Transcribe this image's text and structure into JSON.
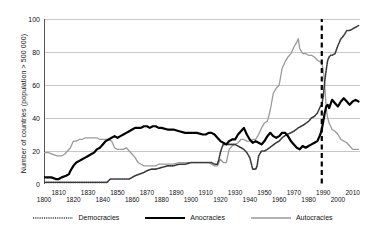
{
  "chart_data": {
    "type": "line",
    "title": "",
    "xlabel": "",
    "ylabel": "Number of countries (population > 500 000)",
    "xlim": [
      1800,
      2015
    ],
    "ylim": [
      0,
      100
    ],
    "grid": true,
    "legend_position": "bottom",
    "xticks": [
      1800,
      1810,
      1820,
      1830,
      1840,
      1850,
      1860,
      1870,
      1880,
      1890,
      1900,
      1910,
      1920,
      1930,
      1940,
      1950,
      1960,
      1970,
      1980,
      1990,
      2000,
      2010
    ],
    "yticks": [
      0,
      20,
      40,
      60,
      80,
      100
    ],
    "annotations": [
      {
        "type": "vline",
        "x": 1989,
        "style": "dashed",
        "color": "#000000",
        "label": ""
      }
    ],
    "series": [
      {
        "name": "Democracies",
        "color": "#3a3a3a",
        "style": "dotted",
        "width": 1.6,
        "x": [
          1800,
          1805,
          1810,
          1815,
          1820,
          1825,
          1830,
          1835,
          1840,
          1843,
          1845,
          1846,
          1848,
          1850,
          1852,
          1855,
          1858,
          1860,
          1862,
          1865,
          1868,
          1870,
          1873,
          1876,
          1880,
          1884,
          1888,
          1892,
          1896,
          1900,
          1904,
          1908,
          1910,
          1912,
          1914,
          1916,
          1918,
          1919,
          1920,
          1921,
          1922,
          1924,
          1926,
          1928,
          1930,
          1932,
          1934,
          1936,
          1938,
          1940,
          1942,
          1944,
          1945,
          1946,
          1948,
          1950,
          1952,
          1955,
          1958,
          1960,
          1962,
          1965,
          1968,
          1970,
          1973,
          1975,
          1977,
          1980,
          1982,
          1984,
          1986,
          1988,
          1989,
          1990,
          1991,
          1992,
          1993,
          1994,
          1995,
          1996,
          1998,
          2000,
          2002,
          2004,
          2006,
          2008,
          2010,
          2012,
          2014
        ],
        "y": [
          1,
          1,
          1,
          1,
          1,
          1,
          1,
          1,
          1,
          1,
          3,
          3,
          3,
          3,
          3,
          3,
          3,
          4,
          5,
          6,
          7,
          8,
          9,
          9,
          10,
          11,
          11,
          12,
          12,
          13,
          13,
          13,
          13,
          13,
          13,
          12,
          12,
          15,
          19,
          22,
          24,
          24,
          24,
          24,
          24,
          23,
          22,
          21,
          19,
          16,
          9,
          9,
          11,
          17,
          20,
          20,
          21,
          23,
          25,
          26,
          28,
          30,
          31,
          32,
          34,
          35,
          36,
          38,
          40,
          41,
          43,
          47,
          48,
          53,
          62,
          69,
          75,
          77,
          78,
          78,
          79,
          84,
          88,
          90,
          93,
          93,
          94,
          95,
          96
        ]
      },
      {
        "name": "Anocracies",
        "color": "#000000",
        "style": "solid",
        "width": 2.2,
        "x": [
          1800,
          1805,
          1808,
          1810,
          1812,
          1815,
          1817,
          1818,
          1820,
          1822,
          1824,
          1826,
          1828,
          1830,
          1832,
          1834,
          1836,
          1838,
          1840,
          1842,
          1844,
          1846,
          1848,
          1850,
          1852,
          1854,
          1856,
          1858,
          1860,
          1862,
          1864,
          1866,
          1868,
          1870,
          1872,
          1874,
          1876,
          1878,
          1880,
          1884,
          1888,
          1892,
          1896,
          1900,
          1904,
          1908,
          1910,
          1912,
          1914,
          1916,
          1918,
          1920,
          1922,
          1924,
          1926,
          1928,
          1930,
          1932,
          1934,
          1936,
          1938,
          1940,
          1942,
          1944,
          1946,
          1948,
          1950,
          1952,
          1954,
          1956,
          1958,
          1960,
          1962,
          1964,
          1966,
          1968,
          1970,
          1972,
          1974,
          1976,
          1978,
          1980,
          1982,
          1984,
          1986,
          1988,
          1989,
          1990,
          1991,
          1992,
          1993,
          1994,
          1996,
          1998,
          2000,
          2002,
          2004,
          2006,
          2008,
          2010,
          2012,
          2014
        ],
        "y": [
          4,
          4,
          3,
          3,
          4,
          5,
          6,
          8,
          11,
          13,
          14,
          15,
          16,
          17,
          18,
          19,
          21,
          22,
          24,
          26,
          27,
          28,
          29,
          28,
          29,
          30,
          31,
          32,
          33,
          34,
          34,
          34,
          35,
          35,
          34,
          35,
          35,
          34,
          34,
          33,
          33,
          32,
          31,
          31,
          31,
          30,
          30,
          31,
          31,
          30,
          28,
          26,
          25,
          24,
          26,
          27,
          27,
          30,
          32,
          34,
          30,
          27,
          25,
          26,
          25,
          24,
          26,
          29,
          31,
          29,
          28,
          29,
          31,
          31,
          29,
          26,
          24,
          22,
          21,
          23,
          22,
          23,
          24,
          25,
          26,
          30,
          33,
          38,
          43,
          47,
          48,
          46,
          51,
          49,
          47,
          50,
          52,
          50,
          48,
          50,
          51,
          50
        ]
      },
      {
        "name": "Autocracies",
        "color": "#9a9a9a",
        "style": "solid",
        "width": 1.3,
        "x": [
          1800,
          1803,
          1806,
          1809,
          1812,
          1814,
          1816,
          1818,
          1820,
          1822,
          1824,
          1826,
          1828,
          1830,
          1832,
          1834,
          1836,
          1838,
          1840,
          1842,
          1844,
          1846,
          1848,
          1850,
          1852,
          1854,
          1856,
          1858,
          1860,
          1862,
          1864,
          1866,
          1868,
          1870,
          1872,
          1874,
          1876,
          1878,
          1880,
          1884,
          1888,
          1892,
          1896,
          1900,
          1904,
          1908,
          1910,
          1912,
          1914,
          1916,
          1918,
          1920,
          1922,
          1924,
          1926,
          1928,
          1930,
          1932,
          1934,
          1936,
          1938,
          1940,
          1942,
          1944,
          1946,
          1948,
          1950,
          1952,
          1954,
          1956,
          1958,
          1960,
          1962,
          1964,
          1966,
          1968,
          1970,
          1972,
          1973,
          1974,
          1976,
          1978,
          1980,
          1982,
          1984,
          1986,
          1988,
          1989,
          1990,
          1991,
          1992,
          1993,
          1994,
          1996,
          1998,
          2000,
          2002,
          2004,
          2006,
          2008,
          2010,
          2012,
          2014
        ],
        "y": [
          19,
          19,
          18,
          17,
          17,
          18,
          20,
          22,
          26,
          26,
          27,
          27,
          28,
          28,
          28,
          28,
          28,
          27,
          27,
          27,
          27,
          26,
          22,
          21,
          21,
          21,
          22,
          20,
          18,
          16,
          13,
          12,
          11,
          11,
          11,
          11,
          11,
          12,
          12,
          12,
          12,
          13,
          13,
          13,
          13,
          13,
          13,
          13,
          12,
          11,
          11,
          15,
          13,
          13,
          21,
          23,
          24,
          25,
          27,
          27,
          26,
          26,
          27,
          27,
          30,
          34,
          37,
          38,
          45,
          55,
          58,
          60,
          70,
          74,
          77,
          79,
          83,
          86,
          88,
          82,
          79,
          79,
          78,
          78,
          77,
          75,
          74,
          73,
          69,
          60,
          46,
          40,
          37,
          33,
          32,
          30,
          27,
          26,
          25,
          23,
          21,
          21,
          21
        ]
      }
    ]
  },
  "legend": {
    "items": [
      {
        "label": "Democracies",
        "key": "dotted-dark"
      },
      {
        "label": "Anocracies",
        "key": "solid-black-thick"
      },
      {
        "label": "Autocracies",
        "key": "solid-gray-thin"
      }
    ]
  }
}
